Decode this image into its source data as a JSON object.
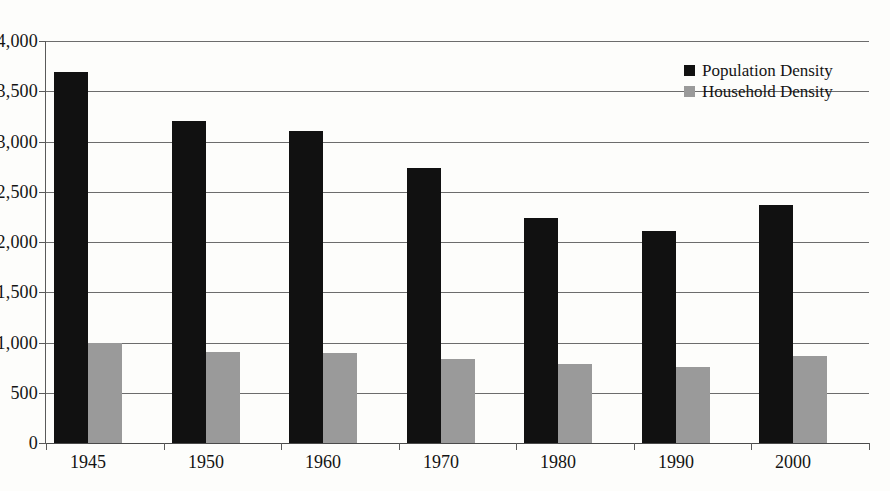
{
  "chart_data": {
    "type": "bar",
    "title": "",
    "subtitle": "",
    "xlabel": "",
    "ylabel": "",
    "categories": [
      "1945",
      "1950",
      "1960",
      "1970",
      "1980",
      "1990",
      "2000"
    ],
    "series": [
      {
        "name": "Population Density",
        "color": "#111111",
        "values": [
          3690,
          3200,
          3100,
          2740,
          2240,
          2110,
          2370
        ]
      },
      {
        "name": "Household Density",
        "color": "#9a9a9a",
        "values": [
          1000,
          910,
          900,
          840,
          790,
          760,
          870
        ]
      }
    ],
    "ylim": [
      0,
      4000
    ],
    "ytick_values": [
      0,
      500,
      1000,
      1500,
      2000,
      2500,
      3000,
      3500,
      4000
    ],
    "ytick_labels": [
      "0",
      "500",
      "1,000",
      "1,500",
      "2,000",
      "2,500",
      "3,000",
      "3,500",
      "4,000"
    ],
    "grid": true,
    "grid_axis": "y",
    "legend_position": "top-right",
    "legend_entries": [
      {
        "label": "Population Density",
        "swatch_color": "#111111",
        "marker": "square"
      },
      {
        "label": "Household Density",
        "swatch_color": "#9a9a9a",
        "marker": "square"
      }
    ],
    "background_color": "#fdfdfb",
    "axis_color": "#5a5a5a"
  }
}
